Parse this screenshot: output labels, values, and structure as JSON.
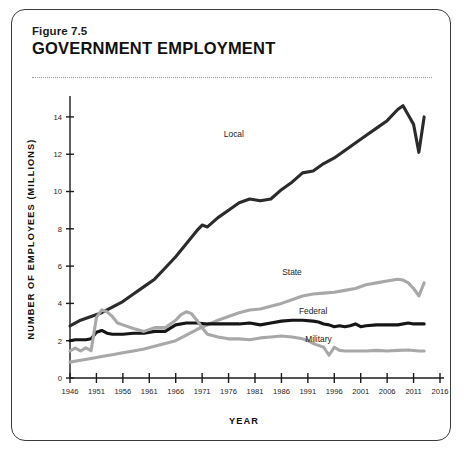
{
  "figure": {
    "number": "Figure 7.5",
    "title": "GOVERNMENT EMPLOYMENT"
  },
  "chart_data": {
    "type": "line",
    "title": "GOVERNMENT EMPLOYMENT",
    "xlabel": "YEAR",
    "ylabel": "NUMBER OF EMPLOYEES (MILLIONS)",
    "xlim": [
      1946,
      2016
    ],
    "ylim": [
      0,
      14.8
    ],
    "xticks": [
      1946,
      1951,
      1956,
      1961,
      1966,
      1971,
      1976,
      1981,
      1986,
      1991,
      1996,
      2001,
      2006,
      2011,
      2016
    ],
    "xtick_labels": [
      "1946",
      "1951",
      "1956",
      "1961",
      "1966",
      "1971",
      "1976",
      "1981",
      "1986",
      "1991",
      "1996",
      "2001",
      "2006",
      "2011",
      "2016"
    ],
    "yticks": [
      0,
      2,
      4,
      6,
      8,
      10,
      12,
      14
    ],
    "ytick_labels": [
      "0",
      "2",
      "4",
      "6",
      "8",
      "10",
      "12",
      "14"
    ],
    "grid": false,
    "legend": "inline-labels",
    "colors": {
      "dark": "#2b2b2b",
      "gray": "#a8a8a8",
      "axis": "#1c1c1c"
    },
    "series": [
      {
        "name": "Local",
        "color": "#2b2b2b",
        "width": 3.1,
        "label_x": 1977,
        "label_y": 12.95,
        "x": [
          1946,
          1948,
          1950,
          1952,
          1954,
          1956,
          1958,
          1960,
          1962,
          1964,
          1966,
          1968,
          1970,
          1971,
          1972,
          1974,
          1976,
          1978,
          1980,
          1982,
          1984,
          1986,
          1988,
          1990,
          1992,
          1994,
          1996,
          1998,
          2000,
          2002,
          2004,
          2006,
          2008,
          2009,
          2010,
          2011,
          2012,
          2013
        ],
        "values": [
          2.8,
          3.1,
          3.3,
          3.5,
          3.8,
          4.1,
          4.5,
          4.9,
          5.3,
          5.9,
          6.5,
          7.2,
          7.9,
          8.2,
          8.1,
          8.6,
          9.0,
          9.4,
          9.6,
          9.5,
          9.6,
          10.1,
          10.5,
          11.0,
          11.1,
          11.5,
          11.8,
          12.2,
          12.6,
          13.0,
          13.4,
          13.8,
          14.4,
          14.6,
          14.1,
          13.6,
          12.1,
          14.0
        ]
      },
      {
        "name": "State",
        "color": "#a8a8a8",
        "width": 3.1,
        "label_x": 1988,
        "label_y": 5.55,
        "x": [
          1946,
          1948,
          1950,
          1952,
          1954,
          1956,
          1958,
          1960,
          1962,
          1964,
          1966,
          1968,
          1970,
          1972,
          1974,
          1976,
          1978,
          1980,
          1982,
          1984,
          1986,
          1988,
          1990,
          1992,
          1994,
          1996,
          1998,
          2000,
          2002,
          2004,
          2006,
          2008,
          2009,
          2010,
          2011,
          2012,
          2013
        ],
        "values": [
          0.85,
          0.95,
          1.05,
          1.15,
          1.25,
          1.35,
          1.45,
          1.55,
          1.7,
          1.85,
          2.0,
          2.3,
          2.6,
          2.85,
          3.1,
          3.3,
          3.5,
          3.65,
          3.7,
          3.85,
          4.0,
          4.2,
          4.4,
          4.5,
          4.55,
          4.6,
          4.7,
          4.8,
          5.0,
          5.1,
          5.2,
          5.3,
          5.25,
          5.1,
          4.8,
          4.4,
          5.1
        ]
      },
      {
        "name": "Federal",
        "color": "#161616",
        "width": 3.1,
        "label_x": 1992,
        "label_y": 3.45,
        "x": [
          1946,
          1947,
          1948,
          1949,
          1950,
          1951,
          1952,
          1953,
          1954,
          1956,
          1958,
          1960,
          1962,
          1964,
          1966,
          1968,
          1970,
          1972,
          1974,
          1976,
          1978,
          1980,
          1982,
          1984,
          1986,
          1988,
          1990,
          1992,
          1993,
          1994,
          1995,
          1996,
          1997,
          1998,
          1999,
          2000,
          2001,
          2002,
          2004,
          2006,
          2008,
          2010,
          2011,
          2012,
          2013
        ],
        "values": [
          2.0,
          2.05,
          2.05,
          2.05,
          2.1,
          2.45,
          2.55,
          2.4,
          2.35,
          2.35,
          2.4,
          2.4,
          2.5,
          2.5,
          2.85,
          2.95,
          2.95,
          2.9,
          2.9,
          2.9,
          2.9,
          2.95,
          2.85,
          2.95,
          3.05,
          3.1,
          3.1,
          3.05,
          3.0,
          2.9,
          2.85,
          2.75,
          2.8,
          2.75,
          2.8,
          2.9,
          2.75,
          2.8,
          2.85,
          2.85,
          2.85,
          2.95,
          2.9,
          2.9,
          2.9
        ]
      },
      {
        "name": "Military",
        "color": "#a8a8a8",
        "width": 3.1,
        "label_x": 1993,
        "label_y": 1.92,
        "x": [
          1946,
          1947,
          1948,
          1949,
          1950,
          1951,
          1952,
          1953,
          1954,
          1955,
          1956,
          1958,
          1960,
          1962,
          1964,
          1966,
          1967,
          1968,
          1969,
          1970,
          1971,
          1972,
          1974,
          1976,
          1978,
          1980,
          1982,
          1984,
          1986,
          1988,
          1990,
          1991,
          1992,
          1993,
          1994,
          1995,
          1996,
          1997,
          1998,
          2000,
          2002,
          2004,
          2006,
          2008,
          2010,
          2012,
          2013
        ],
        "values": [
          1.45,
          1.6,
          1.45,
          1.62,
          1.47,
          3.25,
          3.65,
          3.55,
          3.3,
          2.95,
          2.85,
          2.65,
          2.5,
          2.7,
          2.7,
          3.1,
          3.4,
          3.55,
          3.45,
          3.1,
          2.7,
          2.35,
          2.2,
          2.1,
          2.1,
          2.05,
          2.15,
          2.2,
          2.25,
          2.2,
          2.1,
          2.0,
          1.85,
          1.75,
          1.65,
          1.22,
          1.65,
          1.48,
          1.45,
          1.45,
          1.45,
          1.48,
          1.45,
          1.48,
          1.5,
          1.45,
          1.45
        ]
      }
    ]
  }
}
